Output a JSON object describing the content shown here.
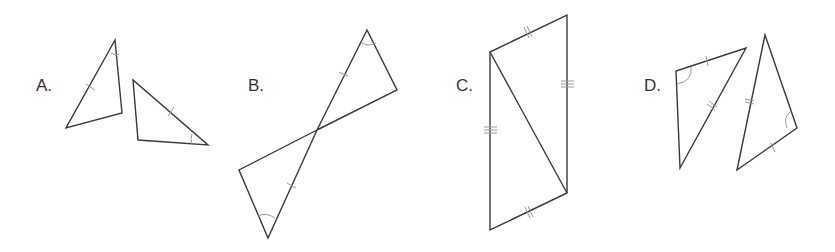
{
  "figures": [
    {
      "label": "A.",
      "description": "Two separate triangles, one pair of congruent sides marked with single tick and one pair of congruent angles marked"
    },
    {
      "label": "B.",
      "description": "Two triangles sharing a vertex (vertical angles), congruent segments marked with single tick and congruent angles at the outer vertices"
    },
    {
      "label": "C.",
      "description": "Quadrilateral split by a diagonal into two triangles; opposite sides marked with double and triple ticks"
    },
    {
      "label": "D.",
      "description": "Two triangles with single-tick side, double-tick side, and an included angle marked"
    }
  ],
  "colors": {
    "line": "#3a3a3a",
    "mark": "#9a9a9a",
    "background": "#ffffff"
  }
}
